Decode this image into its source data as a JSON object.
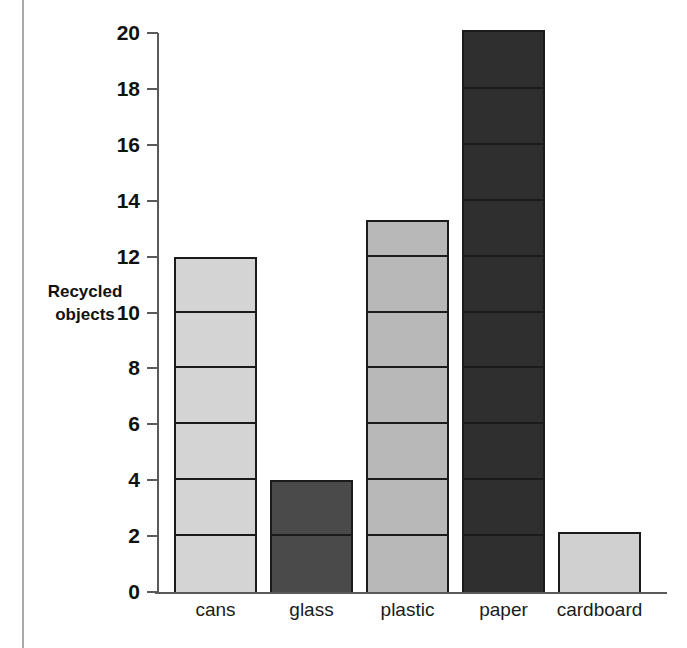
{
  "chart_data": {
    "type": "bar",
    "title": "",
    "xlabel": "",
    "ylabel": "Recycled\nobjects",
    "categories": [
      "cans",
      "glass",
      "plastic",
      "paper",
      "cardboard"
    ],
    "values": [
      12,
      4,
      13.3,
      20.1,
      2.15
    ],
    "ylim": [
      0,
      20
    ],
    "y_ticks": [
      0,
      2,
      4,
      6,
      8,
      10,
      12,
      14,
      16,
      18,
      20
    ],
    "y_tick_labels": [
      "0",
      "2",
      "4",
      "6",
      "8",
      "10",
      "12",
      "14",
      "16",
      "18",
      "20"
    ],
    "grid": false,
    "legend": "none",
    "segment_interval": 2,
    "bar_colors": [
      "#d4d4d4",
      "#4a4a4a",
      "#b8b8b8",
      "#2f2f2f",
      "#d0d0d0"
    ],
    "bar_segmented": [
      true,
      true,
      true,
      true,
      false
    ],
    "bar_outline_color": "#1b1b1b",
    "axis_color": "#5a5a5a"
  }
}
